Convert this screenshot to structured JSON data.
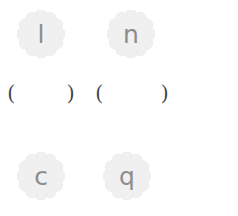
{
  "worksheet": {
    "background_color": "#ffffff",
    "badge_fill_color": "#f0f0f0",
    "badge_edge_color": "#e4e4e4",
    "letter_color": "#8d8d8d",
    "paren_color": "#3b3b3b",
    "badges": [
      {
        "id": "badge-1",
        "letter": "l",
        "icon": "scalloped-flower-badge",
        "row": "top",
        "column": "left"
      },
      {
        "id": "badge-2",
        "letter": "n",
        "icon": "scalloped-flower-badge",
        "row": "top",
        "column": "right"
      },
      {
        "id": "badge-3",
        "letter": "c",
        "icon": "scalloped-flower-badge",
        "row": "bottom",
        "column": "left"
      },
      {
        "id": "badge-4",
        "letter": "q",
        "icon": "scalloped-flower-badge",
        "row": "bottom",
        "column": "right"
      }
    ],
    "blanks": [
      {
        "id": "blank-1",
        "open": "(",
        "value": "",
        "close": ")"
      },
      {
        "id": "blank-2",
        "open": "(",
        "value": "",
        "close": ")"
      }
    ]
  }
}
